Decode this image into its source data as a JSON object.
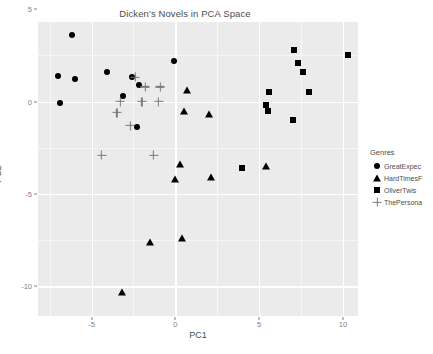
{
  "chart_data": {
    "type": "scatter",
    "title": "Dicken's Novels in PCA Space",
    "xlabel": "PC1",
    "ylabel": "PC2",
    "xlim": [
      -8.2,
      10.9
    ],
    "ylim": [
      -11.6,
      4.3
    ],
    "xticks": [
      -5,
      0,
      5,
      10
    ],
    "xticklabels": [
      "-5",
      "0",
      "5",
      "10"
    ],
    "yticks": [
      5,
      0,
      -5,
      -10
    ],
    "yticklabels": [
      "5",
      "0",
      "-5",
      "-10"
    ],
    "grid": true,
    "legend": {
      "title": "Genres",
      "position": "right",
      "entries": [
        {
          "label": "GreatExpec",
          "marker": "circle"
        },
        {
          "label": "HardTimesF",
          "marker": "triangle"
        },
        {
          "label": "OliverTwis",
          "marker": "square"
        },
        {
          "label": "ThePersona",
          "marker": "plus"
        }
      ]
    },
    "series": [
      {
        "name": "GreatExpec",
        "marker": "circle",
        "color": "#000000",
        "points": [
          [
            -6.2,
            3.6
          ],
          [
            -0.1,
            2.2
          ],
          [
            -7.0,
            1.4
          ],
          [
            -6.0,
            1.2
          ],
          [
            -4.1,
            1.6
          ],
          [
            -2.6,
            1.3
          ],
          [
            -2.2,
            0.9
          ],
          [
            -6.9,
            -0.1
          ],
          [
            -3.1,
            0.3
          ],
          [
            -2.3,
            -1.4
          ]
        ]
      },
      {
        "name": "HardTimesF",
        "marker": "triangle",
        "color": "#000000",
        "points": [
          [
            0.7,
            0.6
          ],
          [
            0.5,
            -0.5
          ],
          [
            2.0,
            -0.7
          ],
          [
            0.3,
            -3.4
          ],
          [
            0.0,
            -4.2
          ],
          [
            2.1,
            -4.1
          ],
          [
            5.4,
            -3.5
          ],
          [
            -1.5,
            -7.6
          ],
          [
            0.4,
            -7.4
          ],
          [
            -3.2,
            -10.3
          ]
        ]
      },
      {
        "name": "OliverTwis",
        "marker": "square",
        "color": "#000000",
        "points": [
          [
            7.1,
            2.8
          ],
          [
            7.3,
            2.1
          ],
          [
            7.6,
            1.6
          ],
          [
            10.3,
            2.5
          ],
          [
            5.6,
            0.5
          ],
          [
            8.0,
            0.5
          ],
          [
            5.5,
            -0.5
          ],
          [
            7.0,
            -1.0
          ],
          [
            5.4,
            -0.2
          ],
          [
            4.0,
            -3.6
          ]
        ]
      },
      {
        "name": "ThePersona",
        "marker": "plus",
        "color": "#7a7a7a",
        "points": [
          [
            -2.4,
            1.3
          ],
          [
            -1.8,
            0.8
          ],
          [
            -0.9,
            0.8
          ],
          [
            -3.3,
            0.0
          ],
          [
            -2.0,
            0.0
          ],
          [
            -1.0,
            0.0
          ],
          [
            -3.5,
            -0.6
          ],
          [
            -2.7,
            -1.3
          ],
          [
            -4.4,
            -2.9
          ],
          [
            -1.3,
            -2.9
          ]
        ]
      }
    ]
  }
}
